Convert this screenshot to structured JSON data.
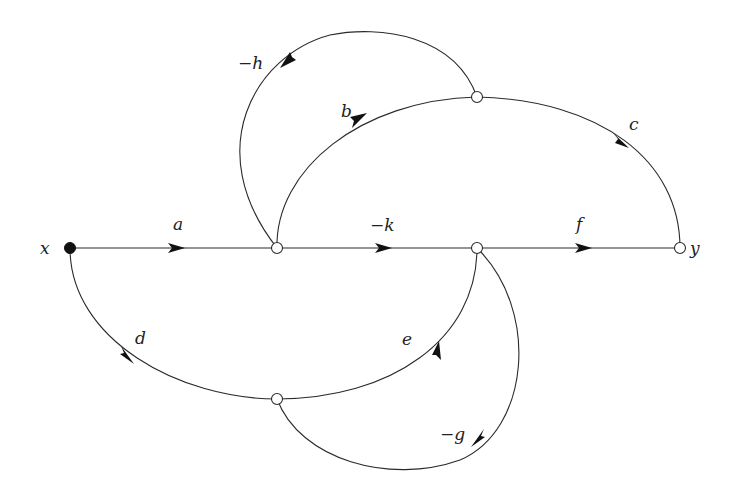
{
  "diagram": {
    "type": "signal-flow-graph",
    "nodes": {
      "input": {
        "label": "x",
        "kind": "source"
      },
      "output": {
        "label": "y",
        "kind": "sink"
      },
      "n1": {
        "label": "",
        "kind": "internal"
      },
      "n2": {
        "label": "",
        "kind": "internal"
      },
      "top": {
        "label": "",
        "kind": "internal"
      },
      "bottom": {
        "label": "",
        "kind": "internal"
      }
    },
    "edges": {
      "a": {
        "label": "a",
        "from": "x",
        "to": "n1"
      },
      "k": {
        "label": "−k",
        "from": "n1",
        "to": "n2"
      },
      "f": {
        "label": "f",
        "from": "n2",
        "to": "y"
      },
      "b": {
        "label": "b",
        "from": "n1",
        "to": "top"
      },
      "c": {
        "label": "c",
        "from": "top",
        "to": "y"
      },
      "h": {
        "label": "−h",
        "from": "top",
        "to": "n1"
      },
      "d": {
        "label": "d",
        "from": "x",
        "to": "bottom"
      },
      "e": {
        "label": "e",
        "from": "bottom",
        "to": "n2"
      },
      "g": {
        "label": "−g",
        "from": "n2",
        "to": "bottom"
      }
    }
  }
}
